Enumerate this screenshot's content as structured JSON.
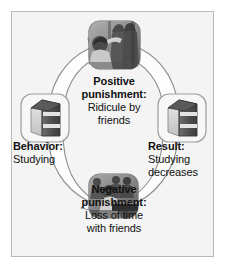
{
  "figure": {
    "background_color": "#f4f4f4",
    "border_color": "#b9b9b9",
    "text_color": "#111111",
    "arrow_fill": "#fdfdfd",
    "arrow_outline": "#8d8d8d"
  },
  "nodes": {
    "behavior": {
      "heading": "Behavior:",
      "body": "Studying",
      "icon": "book-icon",
      "position": "left"
    },
    "positive_punishment": {
      "heading_line1": "Positive",
      "heading_line2": "punishment:",
      "body_line1": "Ridicule by",
      "body_line2": "friends",
      "icon": "photo-people-laughing",
      "position": "top"
    },
    "result": {
      "heading": "Result:",
      "body_line1": "Studying",
      "body_line2": "decreases",
      "icon": "book-icon",
      "position": "right"
    },
    "negative_punishment": {
      "heading_line1": "Negative",
      "heading_line2": "punishment:",
      "body_line1": "Loss of time",
      "body_line2": "with friends",
      "icon": "photo-person-studying",
      "position": "bottom"
    }
  },
  "arrows": [
    {
      "name": "arrow-behavior-to-positive",
      "from": "behavior",
      "to": "positive_punishment",
      "direction": "clockwise"
    },
    {
      "name": "arrow-positive-to-result",
      "from": "positive_punishment",
      "to": "result",
      "direction": "clockwise"
    },
    {
      "name": "arrow-behavior-to-negative",
      "from": "behavior",
      "to": "negative_punishment",
      "direction": "counter-clockwise"
    },
    {
      "name": "arrow-negative-to-result",
      "from": "negative_punishment",
      "to": "result",
      "direction": "counter-clockwise"
    }
  ]
}
